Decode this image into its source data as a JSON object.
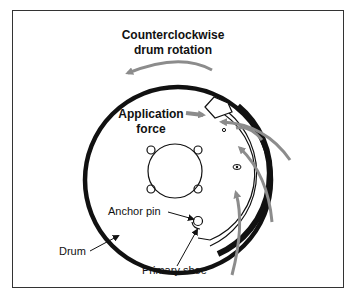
{
  "title": {
    "line1": "Counterclockwise",
    "line2": "drum rotation"
  },
  "labels": {
    "application_force_line1": "Application",
    "application_force_line2": "force",
    "anchor_pin": "Anchor pin",
    "drum": "Drum",
    "primary_shoe": "Primary shoe"
  },
  "colors": {
    "frame": "#333333",
    "drum": "#111111",
    "arrows": "#8c8c8c",
    "text": "#111111"
  }
}
